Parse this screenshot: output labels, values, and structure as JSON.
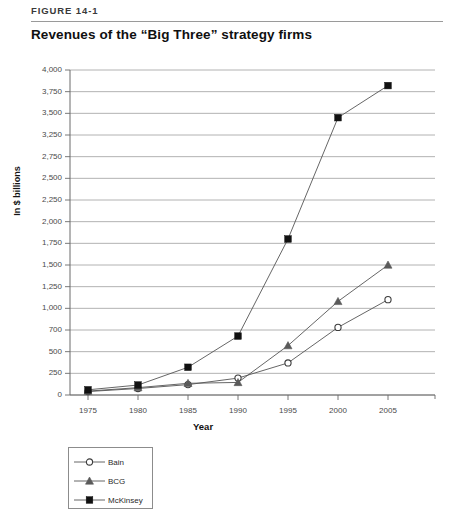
{
  "header": {
    "figure_number": "FIGURE 14-1",
    "title": "Revenues of the “Big Three” strategy firms"
  },
  "axis": {
    "y_title": "In $ billions",
    "x_title": "Year"
  },
  "legend": {
    "items": [
      {
        "label": "Bain",
        "marker": "open-circle-marker",
        "color": "#3c3c3c"
      },
      {
        "label": "BCG",
        "marker": "filled-triangle-marker",
        "color": "#5a5a5a"
      },
      {
        "label": "McKinsey",
        "marker": "filled-square-marker",
        "color": "#111111"
      }
    ]
  },
  "chart_data": {
    "type": "line",
    "title": "Revenues of the “Big Three” strategy firms",
    "xlabel": "Year",
    "ylabel": "In $ billions",
    "x": [
      1975,
      1980,
      1985,
      1990,
      1995,
      2000,
      2005
    ],
    "x_tick_labels": [
      "1975",
      "1980",
      "1985",
      "1990",
      "1995",
      "2000",
      "2005"
    ],
    "y_tick_labels": [
      "4,000",
      "3,750",
      "3,500",
      "3,250",
      "2,750",
      "2,500",
      "2,250",
      "2,000",
      "1,750",
      "1,500",
      "1,250",
      "1,000",
      "700",
      "500",
      "250",
      "0"
    ],
    "y_tick_values": [
      4000,
      3750,
      3500,
      3250,
      2750,
      2500,
      2250,
      2000,
      1750,
      1500,
      1250,
      1000,
      750,
      500,
      250,
      0
    ],
    "ylim": [
      0,
      4000
    ],
    "xlim": [
      1975,
      2005
    ],
    "grid": true,
    "legend_position": "below-axes-left",
    "series": [
      {
        "name": "Bain",
        "values": [
          40,
          75,
          120,
          195,
          370,
          780,
          1100
        ]
      },
      {
        "name": "BCG",
        "values": [
          45,
          85,
          135,
          145,
          570,
          1080,
          1500
        ]
      },
      {
        "name": "McKinsey",
        "values": [
          60,
          115,
          320,
          680,
          1800,
          3450,
          3820
        ]
      }
    ]
  }
}
